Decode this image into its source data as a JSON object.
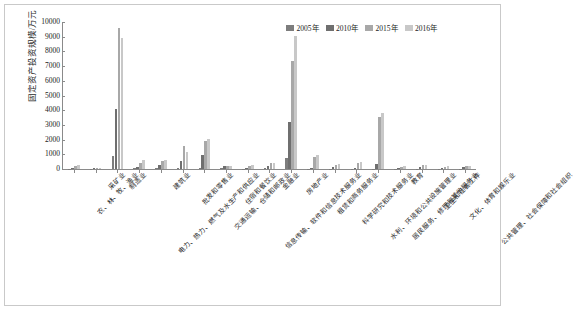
{
  "chart_data": {
    "type": "bar",
    "title": "",
    "subtitle": "",
    "xlabel": "",
    "ylabel": "固定资产投资规模/万元",
    "ylim": [
      0,
      10000
    ],
    "ytick_labels": [
      "10000",
      "9000",
      "8000",
      "7000",
      "6000",
      "5000",
      "4000",
      "3000",
      "2000",
      "1000",
      "0"
    ],
    "ytick_values": [
      10000,
      9000,
      8000,
      7000,
      6000,
      5000,
      4000,
      3000,
      2000,
      1000,
      0
    ],
    "grid": false,
    "legend_position": "top-right",
    "categories": [
      "农、林、牧、渔业",
      "采矿业",
      "制造业",
      "电力、热力、燃气及水生产和供应业",
      "建筑业",
      "批发和零售业",
      "交通运输、仓储和邮政业",
      "住宿和餐饮业",
      "信息传输、软件和信息技术服务业",
      "金融业",
      "房地产业",
      "租赁和商务服务业",
      "科学研究和技术服务业",
      "水利、环境和公共设施管理业",
      "居民服务、修理和其他服务业",
      "教育",
      "卫生和社会工作",
      "文化、体育和娱乐业",
      "公共管理、社会保障和社会组织"
    ],
    "series": [
      {
        "name": "2005年",
        "color": "#7d7d7d",
        "values": [
          30,
          25,
          870,
          60,
          50,
          90,
          60,
          40,
          30,
          45,
          740,
          30,
          20,
          15,
          35,
          25,
          20,
          15,
          20
        ]
      },
      {
        "name": "2010年",
        "color": "#6f6f6f",
        "values": [
          90,
          60,
          4100,
          150,
          300,
          560,
          980,
          180,
          80,
          180,
          3180,
          90,
          160,
          100,
          340,
          95,
          120,
          70,
          110
        ]
      },
      {
        "name": "2015年",
        "color": "#a8a8a8",
        "values": [
          230,
          90,
          9600,
          430,
          520,
          1560,
          1930,
          210,
          230,
          440,
          7360,
          820,
          300,
          420,
          3560,
          160,
          260,
          160,
          210
        ]
      },
      {
        "name": "2016年",
        "color": "#c8c8c8",
        "values": [
          300,
          95,
          8900,
          580,
          620,
          1180,
          2070,
          230,
          250,
          400,
          9080,
          940,
          340,
          460,
          3790,
          190,
          300,
          190,
          230
        ]
      }
    ]
  },
  "legend": {
    "items": [
      {
        "label": "2005年",
        "color": "#7d7d7d"
      },
      {
        "label": "2010年",
        "color": "#6f6f6f"
      },
      {
        "label": "2015年",
        "color": "#a8a8a8"
      },
      {
        "label": "2016年",
        "color": "#c8c8c8"
      }
    ]
  }
}
